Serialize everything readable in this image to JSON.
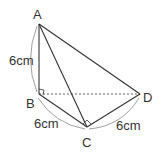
{
  "diagram": {
    "points": {
      "A": {
        "label": "A",
        "x": 39,
        "y": 24
      },
      "B": {
        "label": "B",
        "x": 39,
        "y": 94
      },
      "C": {
        "label": "C",
        "x": 87,
        "y": 127
      },
      "D": {
        "label": "D",
        "x": 140,
        "y": 94
      }
    },
    "measurements": {
      "AB": "6cm",
      "BC": "6cm",
      "CD": "6cm"
    },
    "colors": {
      "line": "#333333",
      "dashed": "#555555",
      "arc": "#888888"
    }
  }
}
